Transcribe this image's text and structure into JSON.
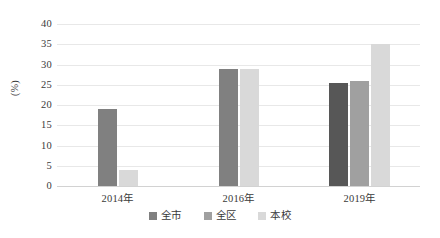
{
  "chart_data": {
    "type": "bar",
    "title": "",
    "xlabel": "",
    "ylabel": "(%)",
    "ylim": [
      0,
      40
    ],
    "ytick_step": 5,
    "yticks": [
      "40",
      "35",
      "30",
      "25",
      "20",
      "15",
      "10",
      "5",
      "0"
    ],
    "grid": true,
    "legend_position": "bottom",
    "categories": [
      "2014年",
      "2016年",
      "2019年"
    ],
    "series": [
      {
        "name": "全市",
        "color": "#808080",
        "values": [
          19,
          29,
          25.5
        ]
      },
      {
        "name": "全区",
        "color": "#a0a0a0",
        "values": [
          null,
          null,
          26
        ]
      },
      {
        "name": "本校",
        "color": "#d9d9d9",
        "values": [
          4,
          29,
          35
        ]
      }
    ]
  },
  "legend": {
    "items": [
      {
        "label": "全市",
        "swatch": "legend-swatch-quanshi"
      },
      {
        "label": "全区",
        "swatch": "legend-swatch-quanqu"
      },
      {
        "label": "本校",
        "swatch": "legend-swatch-benxiao"
      }
    ]
  }
}
